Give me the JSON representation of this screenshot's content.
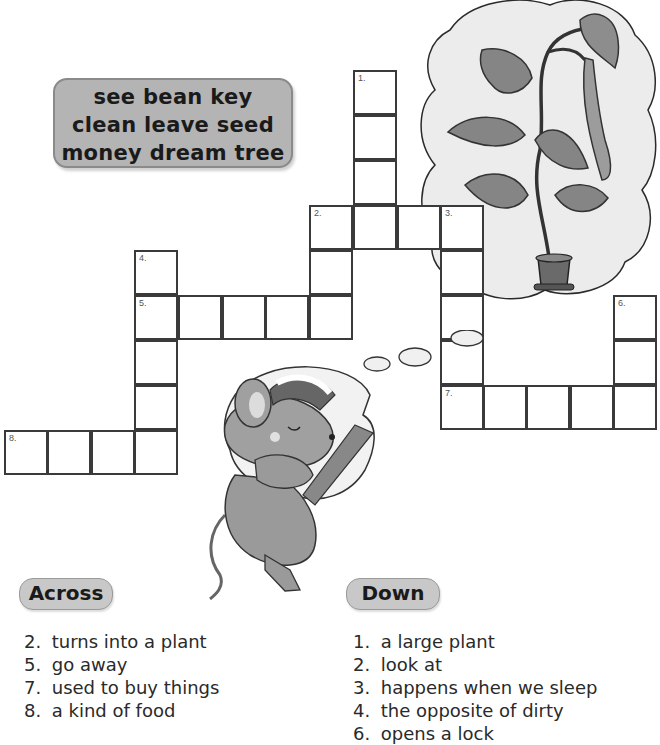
{
  "word_bank": {
    "lines": [
      "see bean key",
      "clean leave seed",
      "money dream tree"
    ]
  },
  "grid": {
    "cell_numbers": {
      "n1": "1.",
      "n2": "2.",
      "n3": "3.",
      "n4": "4.",
      "n5": "5.",
      "n6": "6.",
      "n7": "7.",
      "n8": "8."
    }
  },
  "across": {
    "heading": "Across",
    "clues": [
      {
        "num": "2.",
        "text": "turns into a plant"
      },
      {
        "num": "5.",
        "text": "go away"
      },
      {
        "num": "7.",
        "text": "used to buy things"
      },
      {
        "num": "8.",
        "text": "a kind of food"
      }
    ]
  },
  "down": {
    "heading": "Down",
    "clues": [
      {
        "num": "1.",
        "text": "a large plant"
      },
      {
        "num": "2.",
        "text": "look at"
      },
      {
        "num": "3.",
        "text": "happens when we sleep"
      },
      {
        "num": "4.",
        "text": "the opposite of dirty"
      },
      {
        "num": "6.",
        "text": "opens a lock"
      }
    ]
  },
  "illustrations": {
    "plant": "bean-plant-in-pot-thought-bubble-icon",
    "mouse": "sleeping-mouse-icon"
  }
}
